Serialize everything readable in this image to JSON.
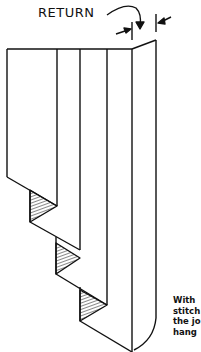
{
  "diagram": {
    "label": "RETURN",
    "caption_lines": [
      "With",
      "stitch",
      "the jo",
      "hang"
    ],
    "colors": {
      "ink": "#111111",
      "background": "#ffffff"
    }
  }
}
